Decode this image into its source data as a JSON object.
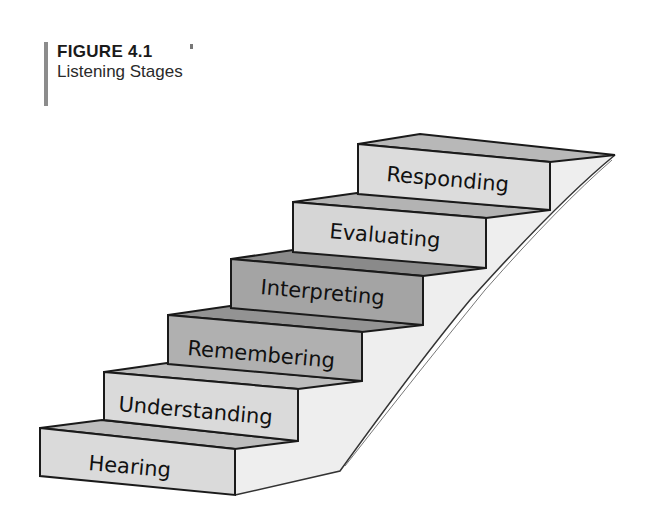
{
  "figure": {
    "number": "FIGURE 4.1",
    "title": "Listening Stages"
  },
  "steps": [
    {
      "label": "Hearing"
    },
    {
      "label": "Understanding"
    },
    {
      "label": "Remembering"
    },
    {
      "label": "Interpreting"
    },
    {
      "label": "Evaluating"
    },
    {
      "label": "Responding"
    }
  ],
  "colors": {
    "light_front": "#dcdcdc",
    "dark_front": "#a9a9a9",
    "light_top": "#b9b9b9",
    "dark_top": "#8f8f8f",
    "wall": "#efefef",
    "outline": "#1a1a1a"
  }
}
